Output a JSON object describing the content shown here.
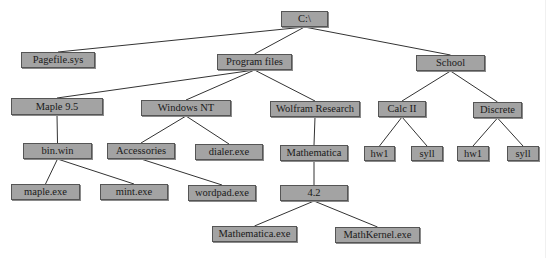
{
  "diagram": {
    "type": "directory-tree",
    "colors": {
      "node_fill": "#a3a3a3",
      "node_border": "#555555",
      "edge": "#333333",
      "background": "#ffffff"
    },
    "nodes": [
      {
        "id": "root",
        "label": "C:\\",
        "x": 281,
        "y": 11,
        "w": 47,
        "h": 16
      },
      {
        "id": "pagefile",
        "label": "Pagefile.sys",
        "x": 21,
        "y": 52,
        "w": 74,
        "h": 16
      },
      {
        "id": "programfiles",
        "label": "Program files",
        "x": 217,
        "y": 54,
        "w": 75,
        "h": 16
      },
      {
        "id": "school",
        "label": "School",
        "x": 416,
        "y": 55,
        "w": 69,
        "h": 16
      },
      {
        "id": "maple95",
        "label": "Maple 9.5",
        "x": 11,
        "y": 98,
        "w": 92,
        "h": 17
      },
      {
        "id": "windowsnt",
        "label": "Windows NT",
        "x": 141,
        "y": 100,
        "w": 90,
        "h": 16
      },
      {
        "id": "wolfram",
        "label": "Wolfram Research",
        "x": 270,
        "y": 101,
        "w": 90,
        "h": 16
      },
      {
        "id": "calcii",
        "label": "Calc II",
        "x": 378,
        "y": 101,
        "w": 48,
        "h": 16
      },
      {
        "id": "discrete",
        "label": "Discrete",
        "x": 473,
        "y": 102,
        "w": 49,
        "h": 16
      },
      {
        "id": "binwin",
        "label": "bin.win",
        "x": 23,
        "y": 143,
        "w": 69,
        "h": 16
      },
      {
        "id": "accessories",
        "label": "Accessories",
        "x": 107,
        "y": 143,
        "w": 68,
        "h": 16
      },
      {
        "id": "dialer",
        "label": "dialer.exe",
        "x": 195,
        "y": 144,
        "w": 68,
        "h": 16
      },
      {
        "id": "mathematica",
        "label": "Mathematica",
        "x": 280,
        "y": 145,
        "w": 68,
        "h": 16
      },
      {
        "id": "calc_hw1",
        "label": "hw1",
        "x": 364,
        "y": 146,
        "w": 31,
        "h": 15
      },
      {
        "id": "calc_syll",
        "label": "syll",
        "x": 411,
        "y": 146,
        "w": 32,
        "h": 15
      },
      {
        "id": "disc_hw1",
        "label": "hw1",
        "x": 457,
        "y": 146,
        "w": 32,
        "h": 15
      },
      {
        "id": "disc_syll",
        "label": "syll",
        "x": 507,
        "y": 146,
        "w": 32,
        "h": 15
      },
      {
        "id": "mapleexe",
        "label": "maple.exe",
        "x": 11,
        "y": 184,
        "w": 69,
        "h": 16
      },
      {
        "id": "mintexe",
        "label": "mint.exe",
        "x": 100,
        "y": 184,
        "w": 68,
        "h": 16
      },
      {
        "id": "wordpad",
        "label": "wordpad.exe",
        "x": 188,
        "y": 185,
        "w": 68,
        "h": 16
      },
      {
        "id": "v42",
        "label": "4.2",
        "x": 280,
        "y": 185,
        "w": 68,
        "h": 16
      },
      {
        "id": "mathematicaexe",
        "label": "Mathematica.exe",
        "x": 212,
        "y": 226,
        "w": 85,
        "h": 16
      },
      {
        "id": "mathkernel",
        "label": "MathKernel.exe",
        "x": 335,
        "y": 227,
        "w": 85,
        "h": 16
      }
    ],
    "edges": [
      [
        "root",
        "pagefile"
      ],
      [
        "root",
        "programfiles"
      ],
      [
        "root",
        "school"
      ],
      [
        "programfiles",
        "maple95"
      ],
      [
        "programfiles",
        "windowsnt"
      ],
      [
        "programfiles",
        "wolfram"
      ],
      [
        "school",
        "calcii"
      ],
      [
        "school",
        "discrete"
      ],
      [
        "maple95",
        "binwin"
      ],
      [
        "windowsnt",
        "accessories"
      ],
      [
        "windowsnt",
        "dialer"
      ],
      [
        "wolfram",
        "mathematica"
      ],
      [
        "calcii",
        "calc_hw1"
      ],
      [
        "calcii",
        "calc_syll"
      ],
      [
        "discrete",
        "disc_hw1"
      ],
      [
        "discrete",
        "disc_syll"
      ],
      [
        "binwin",
        "mapleexe"
      ],
      [
        "binwin",
        "mintexe"
      ],
      [
        "accessories",
        "wordpad"
      ],
      [
        "mathematica",
        "v42"
      ],
      [
        "v42",
        "mathematicaexe"
      ],
      [
        "v42",
        "mathkernel"
      ]
    ]
  }
}
